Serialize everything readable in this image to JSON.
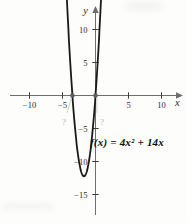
{
  "figure": {
    "background": "#fdfdfc",
    "equation_label": "f(x) = 4x² + 14x",
    "unknown_marker": "?"
  },
  "chart_data": {
    "type": "line",
    "title": "",
    "function": "f(x) = 4x^2 + 14x",
    "coefficients": {
      "a": 4,
      "b": 14,
      "c": 0
    },
    "xlabel": "x",
    "ylabel": "y",
    "x_ticks": [
      -10,
      -5,
      5,
      10
    ],
    "y_ticks": [
      10,
      5,
      -5,
      -10,
      -15
    ],
    "xlim": [
      -12.5,
      13
    ],
    "ylim": [
      -19,
      14.5
    ],
    "grid": false,
    "legend": false,
    "x_intercepts": [
      -3.5,
      0
    ],
    "x_intercepts_labeled_as": [
      "?",
      "?"
    ],
    "vertex": [
      -1.75,
      -12.25
    ],
    "colors": {
      "curve": "#1a1a1a",
      "axis": "#6e6e6e",
      "tick": "#3c3c3c",
      "label": "#2b2b2b",
      "point": "#5f5f5f",
      "muted": "#b5b5b5",
      "leader": "#c9c9c9"
    }
  }
}
